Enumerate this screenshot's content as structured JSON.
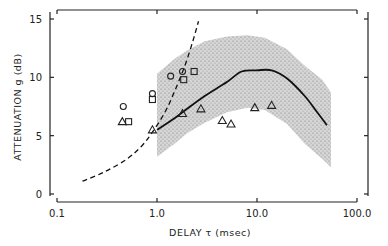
{
  "chart_data": {
    "type": "scatter",
    "title": "",
    "xlabel": "DELAY τ (msec)",
    "ylabel": "ATTENUATION g (dB)",
    "xscale": "log",
    "xlim": [
      0.1,
      100.0
    ],
    "ylim": [
      0,
      15
    ],
    "x_ticks": [
      "0.1",
      "1.0",
      "10.0",
      "100.0"
    ],
    "x_tick_values": [
      0.1,
      1.0,
      10.0,
      100.0
    ],
    "y_ticks": [
      "0",
      "5",
      "10",
      "15"
    ],
    "y_tick_values": [
      0,
      5,
      10,
      15
    ],
    "grid": false,
    "series": [
      {
        "name": "circles",
        "marker": "circle",
        "points": [
          [
            0.46,
            7.5
          ],
          [
            0.9,
            8.6
          ],
          [
            1.37,
            10.1
          ],
          [
            1.8,
            10.5
          ]
        ]
      },
      {
        "name": "squares",
        "marker": "square",
        "points": [
          [
            0.52,
            6.2
          ],
          [
            0.9,
            8.1
          ],
          [
            1.85,
            9.8
          ],
          [
            2.35,
            10.5
          ]
        ]
      },
      {
        "name": "triangles",
        "marker": "triangle",
        "points": [
          [
            0.45,
            6.2
          ],
          [
            0.9,
            5.5
          ],
          [
            1.8,
            6.9
          ],
          [
            2.75,
            7.3
          ],
          [
            4.5,
            6.3
          ],
          [
            5.5,
            6.0
          ],
          [
            9.5,
            7.4
          ],
          [
            14.0,
            7.6
          ]
        ]
      },
      {
        "name": "dashed-curve",
        "style": "dashed",
        "points": [
          [
            0.18,
            1.1
          ],
          [
            0.3,
            1.9
          ],
          [
            0.5,
            3.0
          ],
          [
            0.7,
            4.1
          ],
          [
            0.9,
            5.3
          ],
          [
            1.2,
            7.0
          ],
          [
            1.5,
            8.8
          ],
          [
            1.9,
            11.0
          ],
          [
            2.3,
            13.2
          ],
          [
            2.6,
            14.8
          ]
        ]
      },
      {
        "name": "solid-curve",
        "style": "solid",
        "points": [
          [
            1.0,
            5.5
          ],
          [
            1.5,
            6.5
          ],
          [
            2.0,
            7.3
          ],
          [
            3.0,
            8.4
          ],
          [
            5.0,
            9.6
          ],
          [
            7.0,
            10.5
          ],
          [
            10.0,
            10.6
          ],
          [
            14.0,
            10.6
          ],
          [
            20.0,
            9.9
          ],
          [
            30.0,
            8.4
          ],
          [
            40.0,
            7.0
          ],
          [
            50.0,
            5.9
          ]
        ]
      },
      {
        "name": "shaded-band-upper",
        "style": "band",
        "points": [
          [
            1.0,
            10.3
          ],
          [
            1.5,
            11.6
          ],
          [
            2.0,
            12.3
          ],
          [
            3.0,
            13.1
          ],
          [
            5.0,
            13.5
          ],
          [
            8.0,
            13.6
          ],
          [
            12.0,
            13.4
          ],
          [
            20.0,
            12.4
          ],
          [
            30.0,
            11.0
          ],
          [
            45.0,
            9.8
          ],
          [
            55.0,
            8.7
          ]
        ]
      },
      {
        "name": "shaded-band-lower",
        "style": "band",
        "points": [
          [
            1.0,
            3.2
          ],
          [
            1.5,
            4.3
          ],
          [
            2.0,
            5.2
          ],
          [
            3.0,
            6.1
          ],
          [
            5.0,
            7.0
          ],
          [
            8.0,
            7.4
          ],
          [
            12.0,
            7.2
          ],
          [
            20.0,
            6.0
          ],
          [
            30.0,
            4.3
          ],
          [
            45.0,
            3.0
          ],
          [
            55.0,
            2.3
          ]
        ]
      }
    ]
  }
}
